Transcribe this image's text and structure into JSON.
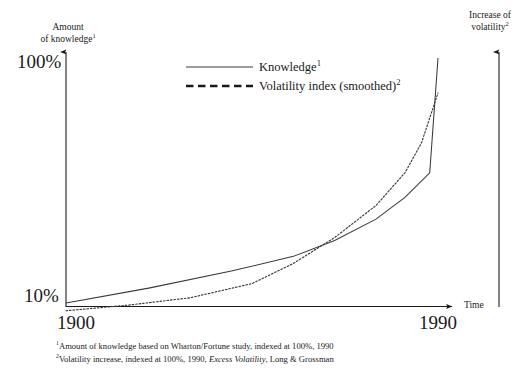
{
  "chart_data": {
    "type": "line",
    "title": "",
    "xlabel": "Time",
    "ylabel_left_line1": "Amount",
    "ylabel_left_line2": "of knowledge",
    "ylabel_right_line1": "Increase of",
    "ylabel_right_line2": "volatility",
    "x_tick_labels": [
      "1900",
      "1990"
    ],
    "y_tick_labels": [
      "10%",
      "100%"
    ],
    "ylim": [
      10,
      100
    ],
    "xlim": [
      1900,
      1990
    ],
    "grid": false,
    "legend_position": "top-center",
    "series": [
      {
        "name": "Knowledge",
        "footnote_marker": "1",
        "style": "solid",
        "x": [
          1900,
          1920,
          1940,
          1955,
          1965,
          1975,
          1982,
          1988,
          1990
        ],
        "y": [
          10.0,
          11.5,
          13.5,
          15.5,
          18.0,
          22.0,
          27.0,
          34.0,
          100.0
        ]
      },
      {
        "name": "Volatility index (smoothed)",
        "footnote_marker": "2",
        "style": "dashed",
        "x": [
          1900,
          1915,
          1930,
          1945,
          1955,
          1965,
          1975,
          1982,
          1986,
          1990
        ],
        "y": [
          9.3,
          9.8,
          10.5,
          12.0,
          14.5,
          18.5,
          25.0,
          34.0,
          45.0,
          72.0
        ]
      }
    ],
    "annotations": [
      "Curves cross at approximately 1955",
      "Knowledge curve rises almost vertically after 1988",
      "Volatility curve exceeds knowledge curve after the crossover"
    ]
  },
  "legend": {
    "items": [
      {
        "label": "Knowledge",
        "marker": "1",
        "style": "solid"
      },
      {
        "label": "Volatility index (smoothed)",
        "marker": "2",
        "style": "dashed"
      }
    ]
  },
  "axes": {
    "left_caption_line1": "Amount",
    "left_caption_line2": "of knowledge",
    "left_caption_marker": "1",
    "right_caption_line1": "Increase of",
    "right_caption_line2": "volatility",
    "right_caption_marker": "2",
    "x_axis_label": "Time",
    "y_top_tick": "100%",
    "y_bottom_tick": "10%",
    "x_start_tick": "1900",
    "x_end_tick": "1990"
  },
  "footnotes": [
    {
      "marker": "1",
      "text": "Amount of knowledge based on Wharton/Fortune study, indexed at 100%, 1990"
    },
    {
      "marker": "2",
      "text_before": "Volatility increase, indexed at 100%, 1990, ",
      "text_italic": "Excess Volatility",
      "text_after": ", Long & Grossman"
    }
  ],
  "colors": {
    "ink": "#1a1a1a",
    "background": "#ffffff",
    "line": "#3a3a3a"
  }
}
